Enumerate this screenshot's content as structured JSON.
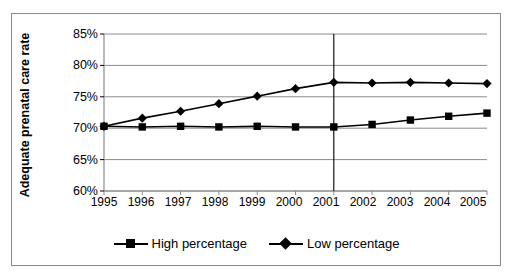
{
  "chart_data": {
    "type": "line",
    "title": "",
    "xlabel": "",
    "ylabel": "Adequate prenatal care rate",
    "categories": [
      "1995",
      "1996",
      "1997",
      "1998",
      "1999",
      "2000",
      "2001",
      "2002",
      "2003",
      "2004",
      "2005"
    ],
    "x": [
      1995,
      1996,
      1997,
      1998,
      1999,
      2000,
      2001,
      2002,
      2003,
      2004,
      2005
    ],
    "ylim": [
      60,
      85
    ],
    "ytick_labels": [
      "85%",
      "80%",
      "75%",
      "70%",
      "65%",
      "60%"
    ],
    "ytick_values": [
      85,
      80,
      75,
      70,
      65,
      60
    ],
    "grid": true,
    "legend_position": "bottom",
    "series": [
      {
        "name": "High percentage",
        "marker": "square",
        "color": "#000000",
        "values": [
          70.3,
          70.2,
          70.3,
          70.2,
          70.3,
          70.2,
          70.2,
          70.6,
          71.3,
          71.9,
          72.4
        ]
      },
      {
        "name": "Low percentage",
        "marker": "diamond",
        "color": "#000000",
        "values": [
          70.3,
          71.6,
          72.7,
          73.9,
          75.1,
          76.3,
          77.3,
          77.2,
          77.3,
          77.2,
          77.1
        ]
      }
    ],
    "annotations": [
      {
        "type": "vertical-line",
        "at": "2001",
        "label": "2001 reference line"
      }
    ]
  }
}
